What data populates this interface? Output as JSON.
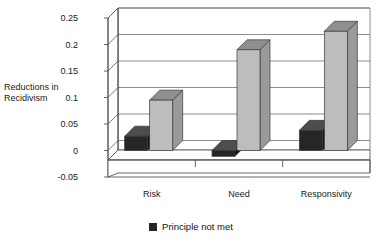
{
  "chart_data": {
    "type": "bar",
    "title": "",
    "subtitle": "",
    "xlabel": "",
    "ylabel": "Reductions in Recidivism",
    "ylabel_line1": "Reductions in",
    "ylabel_line2": "Recidivism",
    "categories": [
      "Risk",
      "Need",
      "Responsivity"
    ],
    "ylim": [
      -0.05,
      0.25
    ],
    "ytick_labels": [
      "0.25",
      "0.2",
      "0.15",
      "0.1",
      "0.05",
      "0",
      "-0.05"
    ],
    "ytick_values": [
      0.25,
      0.2,
      0.15,
      0.1,
      0.05,
      0,
      -0.05
    ],
    "grid": true,
    "legend_position": "bottom-center",
    "style": "3d-bar",
    "series": [
      {
        "name": "Principle not met",
        "color": "#262626",
        "in_legend": true,
        "values": [
          0.027,
          -0.011,
          0.038
        ]
      },
      {
        "name": "",
        "color": "#bdbdbd",
        "in_legend": false,
        "values": [
          0.095,
          0.19,
          0.225
        ]
      }
    ]
  },
  "legend": {
    "items": [
      {
        "label": "Principle not met",
        "swatch_color": "#262626"
      }
    ]
  },
  "colors": {
    "series_dark": "#262626",
    "series_dark_top": "#4d4d4d",
    "series_dark_side": "#111111",
    "series_light": "#bdbdbd",
    "series_light_top": "#8f8f8f",
    "series_light_side": "#9a9a9a",
    "axis": "#555555",
    "grid": "#808080",
    "background": "#ffffff",
    "text": "#1a1a1a"
  }
}
